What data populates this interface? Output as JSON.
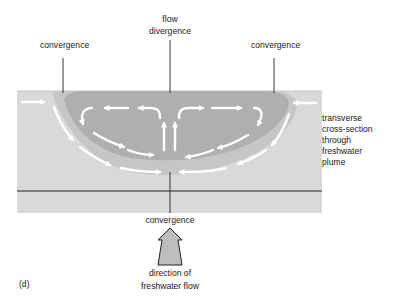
{
  "figure": {
    "panel_label": "(d)",
    "colors": {
      "background": "#ffffff",
      "water": "#d9d9d9",
      "plume_halo": "#c8c8c8",
      "plume": "#b0b0b0",
      "arrows": "#ffffff",
      "lines": "#222222",
      "freshwater_arrow_fill": "#bdbdbd"
    },
    "labels": {
      "convergence_left": "convergence",
      "flow_divergence_line1": "flow",
      "flow_divergence_line2": "divergence",
      "convergence_right": "convergence",
      "convergence_bottom": "convergence",
      "direction_line1": "direction of",
      "direction_line2": "freshwater flow",
      "cross_section": [
        "transverse",
        "cross-section",
        "through",
        "freshwater",
        "plume"
      ]
    },
    "icons": {
      "flow_arrows": "white-curved-arrows",
      "freshwater_flow_arrow": "up-block-arrow"
    }
  }
}
